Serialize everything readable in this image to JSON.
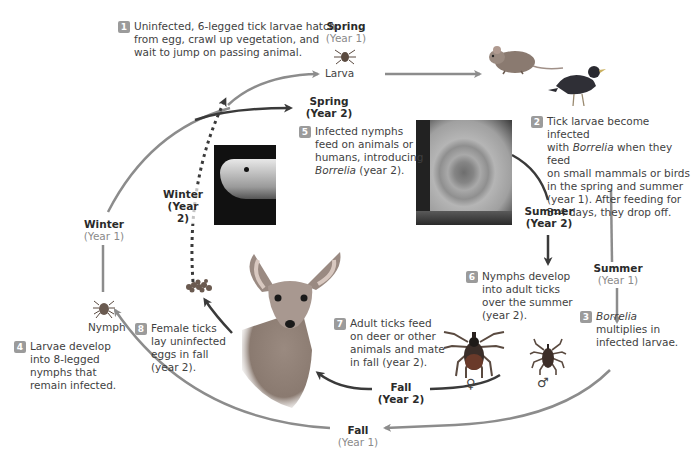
{
  "steps": [
    {
      "num": "1",
      "lines": [
        "Uninfected, 6-legged tick larvae hatch",
        "from egg, crawl up vegetation, and",
        "wait to jump on passing animal."
      ]
    },
    {
      "num": "2",
      "lines": [
        "Tick larvae become infected",
        "with",
        "Borrelia",
        "when they feed",
        "on small mammals or birds",
        "in the spring and summer",
        "(year 1). After feeding for",
        "3–4 days, they drop off."
      ]
    },
    {
      "num": "3",
      "lines": [
        "Borrelia",
        "multiplies in",
        "infected larvae."
      ]
    },
    {
      "num": "4",
      "lines": [
        "Larvae develop",
        "into 8-legged",
        "nymphs that",
        "remain infected."
      ]
    },
    {
      "num": "5",
      "lines": [
        "Infected nymphs",
        "feed on animals or",
        "humans, introducing",
        "Borrelia",
        "(year 2)."
      ]
    },
    {
      "num": "6",
      "lines": [
        "Nymphs develop",
        "into adult ticks",
        "over the summer",
        "(year 2)."
      ]
    },
    {
      "num": "7",
      "lines": [
        "Adult ticks feed",
        "on deer or other",
        "animals and mate",
        "in fall (year 2)."
      ]
    },
    {
      "num": "8",
      "lines": [
        "Female ticks",
        "lay uninfected",
        "eggs in fall",
        "(year 2)."
      ]
    }
  ],
  "seasons": {
    "spring_y1": {
      "name": "Spring",
      "year": "(Year 1)"
    },
    "spring_y2": {
      "name": "Spring",
      "year": "(Year 2)"
    },
    "summer_y1": {
      "name": "Summer",
      "year": "(Year 1)"
    },
    "summer_y2": {
      "name": "Summer",
      "year": "(Year 2)"
    },
    "fall_y1": {
      "name": "Fall",
      "year": "(Year 1)"
    },
    "fall_y2": {
      "name": "Fall",
      "year": "(Year 2)"
    },
    "winter_y1": {
      "name": "Winter",
      "year": "(Year 1)"
    },
    "winter_y2": {
      "name": "Winter",
      "year": "(Year 2)"
    }
  },
  "labels": {
    "larva": "Larva",
    "nymph": "Nymph",
    "female_symbol": "♀",
    "male_symbol": "♂"
  },
  "illustrations": {
    "mouse": "mouse-illustration",
    "bird": "bird-illustration",
    "rash_photo": "bullseye-rash-photo",
    "finger_photo": "tick-on-finger-photo",
    "deer": "deer-illustration",
    "eggs": "tick-eggs-illustration",
    "female_tick": "female-adult-tick",
    "male_tick": "male-adult-tick"
  },
  "colors": {
    "year1_arrow": "#8c8c8c",
    "year2_arrow": "#3a3a3a",
    "badge": "#9b9b9b",
    "year1_text": "#8a8a8a"
  }
}
